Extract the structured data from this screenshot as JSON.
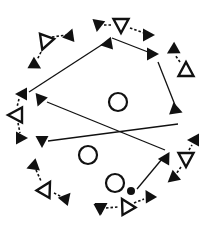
{
  "diagram": {
    "title": "Circular passing drill",
    "colors": {
      "stroke": "#111111",
      "fill": "#111111",
      "background": "#ffffff"
    },
    "players": [
      {
        "id": "p1",
        "shape": "open-triangle",
        "x": 45,
        "y": 42,
        "rot": 200
      },
      {
        "id": "p2",
        "shape": "open-triangle",
        "x": 121,
        "y": 25,
        "rot": 180
      },
      {
        "id": "p3",
        "shape": "open-triangle",
        "x": 186,
        "y": 70,
        "rot": 0
      },
      {
        "id": "p4",
        "shape": "open-triangle",
        "x": 16,
        "y": 115,
        "rot": 270
      },
      {
        "id": "p5",
        "shape": "open-triangle",
        "x": 46,
        "y": 189,
        "rot": 30
      },
      {
        "id": "p6",
        "shape": "open-triangle",
        "x": 126,
        "y": 206,
        "rot": 330
      },
      {
        "id": "p7",
        "shape": "open-triangle",
        "x": 186,
        "y": 159,
        "rot": 180
      }
    ],
    "cones": [
      {
        "id": "c1",
        "x": 118,
        "y": 102,
        "r": 9
      },
      {
        "id": "c2",
        "x": 88,
        "y": 155,
        "r": 9
      },
      {
        "id": "c3",
        "x": 115,
        "y": 183,
        "r": 9
      }
    ],
    "ball": {
      "x": 131,
      "y": 191,
      "r": 4
    },
    "markers": [
      {
        "x": 70,
        "y": 35,
        "rot": 20
      },
      {
        "x": 35,
        "y": 65,
        "rot": 120
      },
      {
        "x": 98,
        "y": 25,
        "rot": 190
      },
      {
        "x": 148,
        "y": 35,
        "rot": 90
      },
      {
        "x": 107,
        "y": 44,
        "rot": 260
      },
      {
        "x": 152,
        "y": 54,
        "rot": 90
      },
      {
        "x": 173,
        "y": 50,
        "rot": 240
      },
      {
        "x": 22,
        "y": 94,
        "rot": 270
      },
      {
        "x": 40,
        "y": 100,
        "rot": 200
      },
      {
        "x": 21,
        "y": 138,
        "rot": 90
      },
      {
        "x": 42,
        "y": 141,
        "rot": 180
      },
      {
        "x": 33,
        "y": 166,
        "rot": 250
      },
      {
        "x": 66,
        "y": 198,
        "rot": 40
      },
      {
        "x": 176,
        "y": 110,
        "rot": 110
      },
      {
        "x": 194,
        "y": 140,
        "rot": 270
      },
      {
        "x": 166,
        "y": 158,
        "rot": 30
      },
      {
        "x": 173,
        "y": 178,
        "rot": 230
      },
      {
        "x": 100,
        "y": 209,
        "rot": 180
      },
      {
        "x": 149,
        "y": 196,
        "rot": 330
      },
      {
        "x": 101,
        "y": 208,
        "rot": 180
      }
    ],
    "solid_lines": [
      {
        "x1": 29,
        "y1": 92,
        "x2": 103,
        "y2": 44
      },
      {
        "x1": 112,
        "y1": 38,
        "x2": 148,
        "y2": 52
      },
      {
        "x1": 158,
        "y1": 62,
        "x2": 175,
        "y2": 105
      },
      {
        "x1": 47,
        "y1": 102,
        "x2": 165,
        "y2": 150
      },
      {
        "x1": 178,
        "y1": 124,
        "x2": 48,
        "y2": 141
      },
      {
        "x1": 137,
        "y1": 189,
        "x2": 162,
        "y2": 159
      }
    ],
    "dashed_lines": [
      {
        "x1": 52,
        "y1": 37,
        "x2": 67,
        "y2": 35
      },
      {
        "x1": 41,
        "y1": 52,
        "x2": 37,
        "y2": 60
      },
      {
        "x1": 104,
        "y1": 25,
        "x2": 113,
        "y2": 25
      },
      {
        "x1": 130,
        "y1": 28,
        "x2": 144,
        "y2": 33
      },
      {
        "x1": 180,
        "y1": 62,
        "x2": 175,
        "y2": 55
      },
      {
        "x1": 19,
        "y1": 99,
        "x2": 17,
        "y2": 107
      },
      {
        "x1": 18,
        "y1": 123,
        "x2": 20,
        "y2": 133
      },
      {
        "x1": 36,
        "y1": 170,
        "x2": 41,
        "y2": 181
      },
      {
        "x1": 54,
        "y1": 193,
        "x2": 62,
        "y2": 197
      },
      {
        "x1": 189,
        "y1": 150,
        "x2": 192,
        "y2": 145
      },
      {
        "x1": 181,
        "y1": 167,
        "x2": 176,
        "y2": 174
      },
      {
        "x1": 106,
        "y1": 208,
        "x2": 118,
        "y2": 207
      },
      {
        "x1": 134,
        "y1": 203,
        "x2": 144,
        "y2": 199
      }
    ]
  }
}
